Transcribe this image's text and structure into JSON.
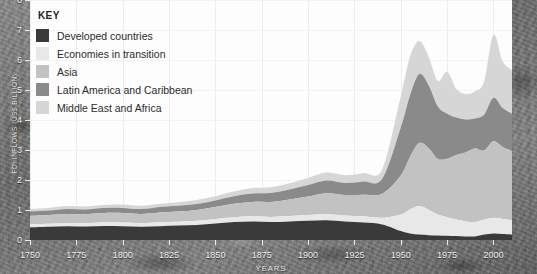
{
  "legend": {
    "title": "KEY",
    "items": [
      {
        "label": "Developed countries",
        "color": "#3a3a3a"
      },
      {
        "label": "Economies in transition",
        "color": "#e8e8e8"
      },
      {
        "label": "Asia",
        "color": "#c2c2c2"
      },
      {
        "label": "Latin America and Caribbean",
        "color": "#8a8a8a"
      },
      {
        "label": "Middle East and Africa",
        "color": "#d6d6d6"
      }
    ]
  },
  "axes": {
    "x_title": "YEARS",
    "y_title": "FDI INFLOWS (US$ BILLION)"
  },
  "chart_data": {
    "type": "area",
    "title": "",
    "xlabel": "YEARS",
    "ylabel": "",
    "xlim": [
      1750,
      2010
    ],
    "ylim": [
      0,
      8
    ],
    "xticks": [
      1750,
      1775,
      1800,
      1825,
      1850,
      1875,
      1900,
      1925,
      1950,
      1975,
      2000
    ],
    "yticks": [
      0,
      1,
      2,
      3,
      4,
      5,
      6,
      7,
      8
    ],
    "grid": "vertical-faint",
    "legend_position": "top-left-inside",
    "stacked": true,
    "x": [
      1750,
      1760,
      1770,
      1780,
      1790,
      1800,
      1810,
      1820,
      1830,
      1840,
      1850,
      1860,
      1870,
      1880,
      1890,
      1900,
      1910,
      1920,
      1930,
      1940,
      1950,
      1955,
      1960,
      1965,
      1970,
      1975,
      1980,
      1985,
      1990,
      1995,
      2000,
      2005,
      2010
    ],
    "series": [
      {
        "name": "Developed countries",
        "color": "#3a3a3a",
        "values": [
          0.42,
          0.44,
          0.46,
          0.45,
          0.47,
          0.46,
          0.44,
          0.46,
          0.48,
          0.5,
          0.55,
          0.6,
          0.62,
          0.6,
          0.62,
          0.64,
          0.66,
          0.62,
          0.58,
          0.52,
          0.3,
          0.22,
          0.18,
          0.16,
          0.15,
          0.14,
          0.13,
          0.12,
          0.12,
          0.18,
          0.22,
          0.2,
          0.18
        ]
      },
      {
        "name": "Economies in transition",
        "color": "#e8e8e8",
        "values": [
          0.1,
          0.1,
          0.11,
          0.11,
          0.12,
          0.12,
          0.12,
          0.13,
          0.13,
          0.14,
          0.15,
          0.16,
          0.17,
          0.17,
          0.18,
          0.19,
          0.2,
          0.2,
          0.21,
          0.22,
          0.55,
          0.8,
          0.95,
          0.85,
          0.7,
          0.62,
          0.55,
          0.5,
          0.48,
          0.5,
          0.52,
          0.5,
          0.48
        ]
      },
      {
        "name": "Asia",
        "color": "#c2c2c2",
        "values": [
          0.28,
          0.29,
          0.3,
          0.3,
          0.31,
          0.32,
          0.31,
          0.33,
          0.34,
          0.36,
          0.4,
          0.45,
          0.48,
          0.5,
          0.55,
          0.62,
          0.7,
          0.68,
          0.72,
          0.8,
          1.3,
          1.75,
          2.1,
          2.05,
          1.85,
          1.95,
          2.15,
          2.3,
          2.45,
          2.3,
          2.55,
          2.4,
          2.3
        ]
      },
      {
        "name": "Latin America and Caribbean",
        "color": "#8a8a8a",
        "values": [
          0.15,
          0.15,
          0.16,
          0.16,
          0.17,
          0.17,
          0.16,
          0.18,
          0.19,
          0.2,
          0.22,
          0.25,
          0.28,
          0.3,
          0.33,
          0.38,
          0.42,
          0.4,
          0.44,
          0.5,
          1.6,
          2.05,
          2.3,
          2.1,
          1.75,
          1.5,
          1.25,
          1.1,
          1.0,
          1.2,
          1.45,
          1.3,
          1.25
        ]
      },
      {
        "name": "Middle East and Africa",
        "color": "#d6d6d6",
        "values": [
          0.09,
          0.09,
          0.1,
          0.1,
          0.1,
          0.11,
          0.11,
          0.11,
          0.12,
          0.13,
          0.14,
          0.16,
          0.18,
          0.19,
          0.21,
          0.24,
          0.27,
          0.26,
          0.28,
          0.32,
          1.05,
          1.3,
          1.1,
          0.95,
          0.85,
          1.4,
          0.95,
          0.85,
          0.9,
          1.1,
          2.1,
          1.55,
          1.45
        ]
      }
    ]
  }
}
